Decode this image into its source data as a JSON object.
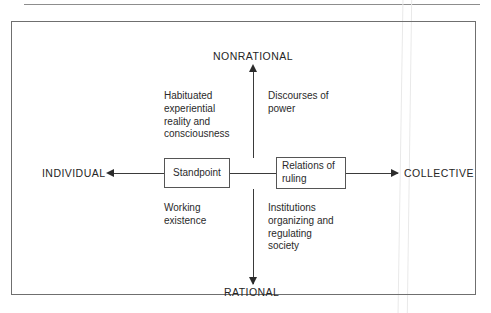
{
  "figure": {
    "type": "conceptual-quadrant-diagram",
    "axes": {
      "vertical": {
        "top_label": "NONRATIONAL",
        "bottom_label": "RATIONAL"
      },
      "horizontal": {
        "left_label": "INDIVIDUAL",
        "right_label": "COLLECTIVE"
      }
    },
    "nodes": [
      {
        "id": "standpoint",
        "label": "Standpoint"
      },
      {
        "id": "relations-of-ruling",
        "label": "Relations of\nruling"
      }
    ],
    "quadrants": {
      "upper_left": "Habituated\nexperiential\nreality and\nconsciousness",
      "upper_right": "Discourses of\npower",
      "lower_left": "Working\nexistence",
      "lower_right": "Institutions\norganizing and\nregulating\nsociety"
    },
    "colors": {
      "ink": "#2a2a2a",
      "rule": "#6f6f6f",
      "axis": "#3a3a3a",
      "background": "#ffffff"
    }
  }
}
